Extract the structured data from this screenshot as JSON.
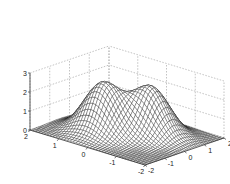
{
  "chart_data": {
    "type": "surface3d",
    "title": "",
    "xlabel": "",
    "ylabel": "",
    "zlabel": "",
    "x_ticks": [
      -2,
      -1,
      0,
      1,
      2
    ],
    "y_ticks": [
      -2,
      -1,
      0,
      1,
      2
    ],
    "z_ticks": [
      0,
      1,
      2,
      3
    ],
    "x_tick_labels": [
      "-2",
      "-1",
      "0",
      "1",
      "2"
    ],
    "y_tick_labels": [
      "-2",
      "-1",
      "0",
      "1",
      "2"
    ],
    "z_tick_labels": [
      "0",
      "1",
      "2",
      "3"
    ],
    "xlim": [
      -2,
      2
    ],
    "ylim": [
      -2,
      2
    ],
    "zlim": [
      0,
      3
    ],
    "grid": true,
    "surface": {
      "description": "Bimodal surface: sum of two Gaussian bumps over [-2,2]x[-2,2]",
      "bumps": [
        {
          "center_x": -0.5,
          "center_y": 0.5,
          "height": 2.6,
          "width": 0.55
        },
        {
          "center_x": 0.5,
          "center_y": -0.5,
          "height": 2.5,
          "width": 0.55
        }
      ],
      "grid_resolution": 40,
      "mesh_color": "#222222",
      "face_color": "#ffffff"
    },
    "colors": {
      "grid": "#9a9a9a",
      "axis": "#333333",
      "mesh": "#1a1a1a"
    }
  }
}
